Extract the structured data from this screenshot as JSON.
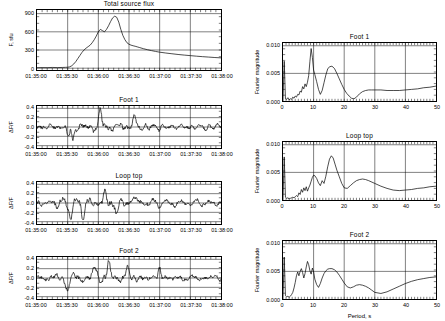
{
  "figure": {
    "title": "Total source flux",
    "panels_left": [
      "Total source flux",
      "Foot 1",
      "Loop top",
      "Foot 2"
    ],
    "panels_right": [
      "Foot 1",
      "Loop top",
      "Foot 2"
    ]
  },
  "chart_data": [
    {
      "type": "line",
      "title": "Total source flux",
      "xlabel": "",
      "ylabel": "F, sfu",
      "xticklabels": [
        "01:35:00",
        "01:35:30",
        "01:36:00",
        "01:36:30",
        "01:37:00",
        "01:37:30",
        "01:38:00"
      ],
      "yticklabels": [
        "0",
        "300",
        "600",
        "900"
      ],
      "ylim": [
        -30,
        960
      ],
      "xlim": [
        0,
        180
      ],
      "grid": true,
      "x": [
        0,
        5,
        10,
        15,
        20,
        25,
        28,
        30,
        32,
        34,
        36,
        38,
        40,
        42,
        44,
        46,
        48,
        50,
        52,
        54,
        56,
        58,
        60,
        62,
        64,
        66,
        68,
        70,
        72,
        74,
        76,
        78,
        80,
        82,
        84,
        86,
        88,
        90,
        92,
        94,
        96,
        98,
        100,
        104,
        108,
        112,
        116,
        120,
        126,
        132,
        138,
        144,
        150,
        156,
        162,
        168,
        174,
        180
      ],
      "y": [
        8,
        10,
        9,
        12,
        10,
        12,
        14,
        16,
        22,
        40,
        70,
        110,
        160,
        210,
        260,
        300,
        330,
        355,
        380,
        420,
        470,
        530,
        600,
        640,
        620,
        600,
        640,
        700,
        770,
        830,
        858,
        840,
        760,
        640,
        540,
        470,
        420,
        395,
        380,
        370,
        362,
        352,
        342,
        322,
        305,
        290,
        276,
        264,
        250,
        238,
        226,
        216,
        207,
        198,
        190,
        183,
        176,
        170
      ]
    },
    {
      "type": "line",
      "title": "Foot 1",
      "xlabel": "",
      "ylabel": "ΔF/F",
      "xticklabels": [
        "01:35:00",
        "01:35:30",
        "01:36:00",
        "01:36:30",
        "01:37:00",
        "01:37:30",
        "01:38:00"
      ],
      "yticklabels": [
        "0.4",
        "0.2",
        "0.0",
        "-0.2",
        "-0.4"
      ],
      "ylim": [
        -0.45,
        0.45
      ],
      "xlim": [
        0,
        180
      ],
      "grid": true,
      "seed": 11,
      "amplitude": 0.14,
      "spikes": [
        [
          31,
          -0.3
        ],
        [
          33,
          0.13
        ],
        [
          35,
          -0.28
        ],
        [
          62,
          0.33
        ],
        [
          95,
          0.22
        ]
      ]
    },
    {
      "type": "line",
      "title": "Loop top",
      "xlabel": "",
      "ylabel": "ΔF/F",
      "xticklabels": [
        "01:35:00",
        "01:35:30",
        "01:36:00",
        "01:36:30",
        "01:37:00",
        "01:37:30",
        "01:38:00"
      ],
      "yticklabels": [
        "0.4",
        "0.2",
        "0.0",
        "-0.2",
        "-0.4"
      ],
      "ylim": [
        -0.45,
        0.45
      ],
      "xlim": [
        0,
        180
      ],
      "grid": true,
      "seed": 23,
      "amplitude": 0.16,
      "spikes": [
        [
          33,
          -0.33
        ],
        [
          45,
          -0.27
        ],
        [
          66,
          0.21
        ],
        [
          78,
          -0.22
        ],
        [
          95,
          0.19
        ]
      ]
    },
    {
      "type": "line",
      "title": "Foot 2",
      "xlabel": "",
      "ylabel": "ΔF/F",
      "xticklabels": [
        "01:35:00",
        "01:35:30",
        "01:36:00",
        "01:36:30",
        "01:37:00",
        "01:37:30",
        "01:38:00"
      ],
      "yticklabels": [
        "0.4",
        "0.2",
        "0.0",
        "-0.2",
        "-0.4"
      ],
      "ylim": [
        -0.45,
        0.45
      ],
      "xlim": [
        0,
        180
      ],
      "grid": true,
      "seed": 37,
      "amplitude": 0.15,
      "spikes": [
        [
          30,
          -0.27
        ],
        [
          57,
          0.26
        ],
        [
          70,
          0.34
        ],
        [
          88,
          0.24
        ],
        [
          120,
          0.21
        ]
      ]
    },
    {
      "type": "line",
      "title": "Foot 1",
      "xlabel": "",
      "ylabel": "Fourier magnitude",
      "xticklabels": [
        "0",
        "10",
        "20",
        "30",
        "40",
        "50"
      ],
      "yticklabels": [
        "0.000",
        "0.005",
        "0.010"
      ],
      "ylim": [
        0,
        0.0105
      ],
      "xlim": [
        0,
        50
      ],
      "grid": true,
      "x": [
        0,
        0.4,
        0.8,
        1.2,
        1.6,
        2,
        2.4,
        2.8,
        3.2,
        3.6,
        4,
        4.4,
        4.8,
        5.2,
        5.6,
        6,
        6.4,
        6.8,
        7.2,
        7.6,
        8,
        8.4,
        8.8,
        9.2,
        9.6,
        10,
        10.4,
        11,
        11.6,
        12.2,
        12.8,
        13.4,
        14,
        14.6,
        15.2,
        16,
        16.8,
        17.6,
        18.4,
        19.2,
        20,
        20.8,
        21.6,
        22.4,
        23.2,
        24,
        25,
        26,
        27,
        28,
        29,
        30,
        32,
        34,
        36,
        38,
        40,
        42,
        44,
        46,
        48,
        50
      ],
      "y": [
        0.0,
        0.0072,
        0.0004,
        0.0003,
        0.0006,
        0.0002,
        0.0004,
        0.0003,
        0.0007,
        0.0005,
        0.0009,
        0.0007,
        0.0012,
        0.0011,
        0.0018,
        0.0016,
        0.0026,
        0.0022,
        0.0031,
        0.0026,
        0.0034,
        0.0046,
        0.0072,
        0.0095,
        0.0079,
        0.0056,
        0.0048,
        0.0035,
        0.0021,
        0.0012,
        0.0019,
        0.0033,
        0.0047,
        0.0058,
        0.0062,
        0.0063,
        0.0059,
        0.005,
        0.004,
        0.003,
        0.0021,
        0.0014,
        0.0009,
        0.0005,
        0.0004,
        0.0007,
        0.0013,
        0.0017,
        0.0019,
        0.002,
        0.002,
        0.002,
        0.002,
        0.0019,
        0.0019,
        0.0019,
        0.002,
        0.0021,
        0.0022,
        0.0024,
        0.0025,
        0.0027
      ]
    },
    {
      "type": "line",
      "title": "Loop top",
      "xlabel": "",
      "ylabel": "Fourier magnitude",
      "xticklabels": [
        "0",
        "10",
        "20",
        "30",
        "40",
        "50"
      ],
      "yticklabels": [
        "0.000",
        "0.005",
        "0.010"
      ],
      "ylim": [
        0,
        0.0105
      ],
      "xlim": [
        0,
        50
      ],
      "grid": true,
      "x": [
        0,
        0.4,
        0.8,
        1.2,
        1.6,
        2,
        2.4,
        2.8,
        3.2,
        3.6,
        4,
        4.4,
        4.8,
        5.2,
        5.6,
        6,
        6.4,
        6.8,
        7.2,
        7.6,
        8,
        8.4,
        8.8,
        9.2,
        9.6,
        10,
        10.4,
        11,
        11.6,
        12.2,
        12.8,
        13.4,
        14,
        14.6,
        15.2,
        15.8,
        16.4,
        17,
        17.6,
        18.4,
        19.2,
        20,
        21,
        22,
        23,
        24,
        25,
        26,
        27,
        28,
        30,
        32,
        34,
        36,
        38,
        40,
        42,
        44,
        46,
        48,
        50
      ],
      "y": [
        0.0,
        0.0078,
        0.0005,
        0.0003,
        0.0004,
        0.0002,
        0.0003,
        0.0004,
        0.0005,
        0.0004,
        0.0006,
        0.0008,
        0.0006,
        0.0013,
        0.001,
        0.0019,
        0.0014,
        0.0022,
        0.0017,
        0.0024,
        0.0016,
        0.0022,
        0.0027,
        0.0034,
        0.0041,
        0.0045,
        0.0044,
        0.0039,
        0.0031,
        0.0026,
        0.0035,
        0.003,
        0.0043,
        0.006,
        0.0074,
        0.008,
        0.0076,
        0.0065,
        0.0054,
        0.0042,
        0.003,
        0.0022,
        0.0021,
        0.0026,
        0.0031,
        0.0035,
        0.0037,
        0.0038,
        0.0037,
        0.0035,
        0.003,
        0.0025,
        0.0021,
        0.0018,
        0.0017,
        0.0018,
        0.0019,
        0.0021,
        0.0022,
        0.0024,
        0.0025
      ]
    },
    {
      "type": "line",
      "title": "Foot 2",
      "xlabel": "Period, s",
      "ylabel": "Fourier magnitude",
      "xticklabels": [
        "0",
        "10",
        "20",
        "30",
        "40",
        "50"
      ],
      "yticklabels": [
        "0.000",
        "0.005",
        "0.010"
      ],
      "ylim": [
        0,
        0.0105
      ],
      "xlim": [
        0,
        50
      ],
      "grid": true,
      "x": [
        0,
        0.4,
        0.8,
        1.2,
        1.6,
        2,
        2.4,
        2.8,
        3.2,
        3.6,
        4,
        4.4,
        4.8,
        5.2,
        5.6,
        6,
        6.4,
        6.8,
        7.2,
        7.6,
        8,
        8.4,
        8.8,
        9.2,
        9.6,
        10,
        10.4,
        11,
        11.6,
        12.2,
        12.8,
        13.4,
        14,
        14.6,
        15.2,
        16,
        16.8,
        17.6,
        18.4,
        19.2,
        20,
        21,
        22,
        23,
        24,
        25,
        26,
        27,
        28,
        29,
        30,
        32,
        34,
        36,
        38,
        40,
        42,
        44,
        46,
        48,
        50
      ],
      "y": [
        0.0,
        0.0076,
        0.0006,
        0.0004,
        0.0005,
        0.0003,
        0.0005,
        0.0008,
        0.0012,
        0.002,
        0.003,
        0.0042,
        0.0049,
        0.0042,
        0.005,
        0.0055,
        0.0048,
        0.0038,
        0.0046,
        0.0058,
        0.0068,
        0.0062,
        0.0051,
        0.0045,
        0.0056,
        0.0049,
        0.0036,
        0.0026,
        0.0021,
        0.0028,
        0.0038,
        0.0046,
        0.0051,
        0.0054,
        0.0055,
        0.0055,
        0.0053,
        0.0049,
        0.0043,
        0.0036,
        0.0029,
        0.0022,
        0.002,
        0.0022,
        0.0025,
        0.0026,
        0.0025,
        0.0023,
        0.002,
        0.0016,
        0.0012,
        0.001,
        0.0013,
        0.0018,
        0.0023,
        0.0028,
        0.0032,
        0.0035,
        0.0037,
        0.0039,
        0.004
      ]
    }
  ]
}
